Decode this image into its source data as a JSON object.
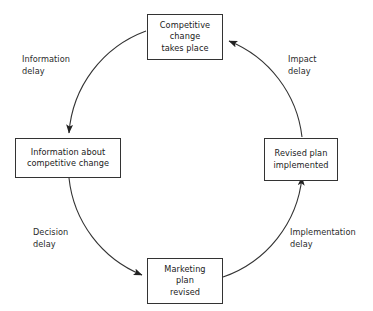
{
  "diagram": {
    "type": "cycle-diagram",
    "title": "",
    "background_color": "#ffffff",
    "stroke_color": "#333333",
    "text_color": "#1a1a1a",
    "direction": "clockwise",
    "nodes": [
      {
        "id": "competitive-change",
        "position": "top",
        "lines": [
          "Competitive",
          "change",
          "takes place"
        ]
      },
      {
        "id": "revised-plan",
        "position": "right",
        "lines": [
          "Revised plan",
          "implemented"
        ]
      },
      {
        "id": "marketing-plan",
        "position": "bottom",
        "lines": [
          "Marketing",
          "plan",
          "revised"
        ]
      },
      {
        "id": "information-about",
        "position": "left",
        "lines": [
          "Information about",
          "competitive change"
        ]
      }
    ],
    "edges": [
      {
        "id": "information-delay",
        "from": "competitive-change",
        "to": "information-about",
        "position": "top-left",
        "lines": [
          "Information",
          "delay"
        ]
      },
      {
        "id": "decision-delay",
        "from": "information-about",
        "to": "marketing-plan",
        "position": "bottom-left",
        "lines": [
          "Decision",
          "delay"
        ]
      },
      {
        "id": "implementation-delay",
        "from": "marketing-plan",
        "to": "revised-plan",
        "position": "bottom-right",
        "lines": [
          "Implementation",
          "delay"
        ]
      },
      {
        "id": "impact-delay",
        "from": "revised-plan",
        "to": "competitive-change",
        "position": "top-right",
        "lines": [
          "Impact",
          "delay"
        ]
      }
    ]
  }
}
